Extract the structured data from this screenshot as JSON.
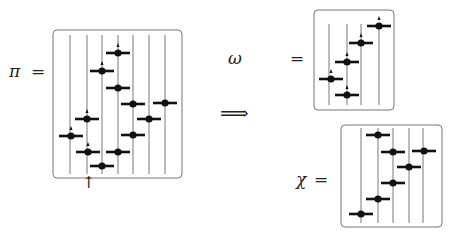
{
  "labels": {
    "pi": "π",
    "omega": "ω",
    "chi": "χ",
    "equals": "=",
    "implies": "⟹",
    "marker_arrow": "↑"
  },
  "diagrams": {
    "pi": {
      "box": [
        53,
        30,
        129,
        148
      ],
      "lines_x": [
        70,
        87,
        102,
        118,
        133,
        149,
        165
      ],
      "line_y": [
        35,
        174
      ],
      "points": [
        {
          "x": 118,
          "y": 53,
          "arrow": true
        },
        {
          "x": 102,
          "y": 71,
          "arrow": true
        },
        {
          "x": 118,
          "y": 88,
          "arrow": false
        },
        {
          "x": 133,
          "y": 104,
          "arrow": false
        },
        {
          "x": 165,
          "y": 103,
          "arrow": false
        },
        {
          "x": 87,
          "y": 119,
          "arrow": true
        },
        {
          "x": 149,
          "y": 119,
          "arrow": false
        },
        {
          "x": 71,
          "y": 136,
          "arrow": true
        },
        {
          "x": 133,
          "y": 135,
          "arrow": false
        },
        {
          "x": 88,
          "y": 152,
          "arrow": true
        },
        {
          "x": 118,
          "y": 152,
          "arrow": false
        },
        {
          "x": 102,
          "y": 166,
          "arrow": false
        }
      ]
    },
    "omega": {
      "box": [
        314,
        10,
        80,
        100
      ],
      "lines_x": [
        329,
        347,
        361,
        379
      ],
      "line_y": [
        24,
        105
      ],
      "points": [
        {
          "x": 379,
          "y": 26,
          "arrow": true
        },
        {
          "x": 361,
          "y": 43,
          "arrow": true
        },
        {
          "x": 347,
          "y": 62,
          "arrow": true
        },
        {
          "x": 331,
          "y": 79,
          "arrow": true
        },
        {
          "x": 347,
          "y": 95,
          "arrow": true
        }
      ]
    },
    "chi": {
      "box": [
        341,
        125,
        101,
        102
      ],
      "lines_x": [
        361,
        378,
        393,
        409,
        423
      ],
      "line_y": [
        128,
        223
      ],
      "points": [
        {
          "x": 378,
          "y": 135,
          "arrow": false
        },
        {
          "x": 393,
          "y": 152,
          "arrow": false
        },
        {
          "x": 424,
          "y": 151,
          "arrow": false
        },
        {
          "x": 409,
          "y": 167,
          "arrow": false
        },
        {
          "x": 393,
          "y": 183,
          "arrow": false
        },
        {
          "x": 378,
          "y": 199,
          "arrow": false
        },
        {
          "x": 361,
          "y": 214,
          "arrow": false
        }
      ]
    }
  }
}
